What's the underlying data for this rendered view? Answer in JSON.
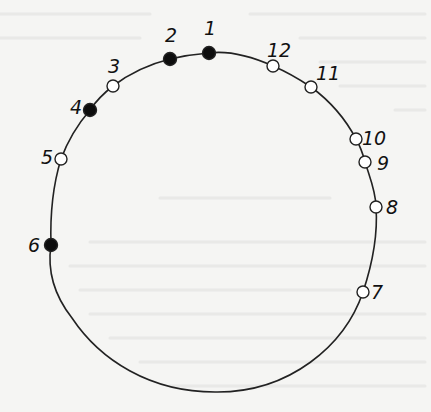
{
  "diagram": {
    "type": "circle-with-numbered-points",
    "stroke_color": "#222222",
    "filled_color": "#0d0d0d",
    "open_fill_color": "#ffffff",
    "points": [
      {
        "label": "1",
        "x": 209,
        "y": 53,
        "filled": true,
        "label_x": 204,
        "label_y": 35
      },
      {
        "label": "2",
        "x": 170,
        "y": 59,
        "filled": true,
        "label_x": 165,
        "label_y": 42
      },
      {
        "label": "3",
        "x": 113,
        "y": 86,
        "filled": false,
        "label_x": 108,
        "label_y": 73
      },
      {
        "label": "4",
        "x": 90,
        "y": 110,
        "filled": true,
        "label_x": 70,
        "label_y": 114
      },
      {
        "label": "5",
        "x": 61,
        "y": 159,
        "filled": false,
        "label_x": 41,
        "label_y": 164
      },
      {
        "label": "6",
        "x": 51,
        "y": 245,
        "filled": true,
        "label_x": 28,
        "label_y": 252
      },
      {
        "label": "7",
        "x": 363,
        "y": 292,
        "filled": false,
        "label_x": 371,
        "label_y": 299
      },
      {
        "label": "8",
        "x": 376,
        "y": 207,
        "filled": false,
        "label_x": 386,
        "label_y": 214
      },
      {
        "label": "9",
        "x": 365,
        "y": 162,
        "filled": false,
        "label_x": 377,
        "label_y": 170
      },
      {
        "label": "10",
        "x": 356,
        "y": 139,
        "filled": false,
        "label_x": 362,
        "label_y": 145
      },
      {
        "label": "11",
        "x": 311,
        "y": 87,
        "filled": false,
        "label_x": 316,
        "label_y": 80
      },
      {
        "label": "12",
        "x": 273,
        "y": 66,
        "filled": false,
        "label_x": 267,
        "label_y": 57
      }
    ]
  }
}
